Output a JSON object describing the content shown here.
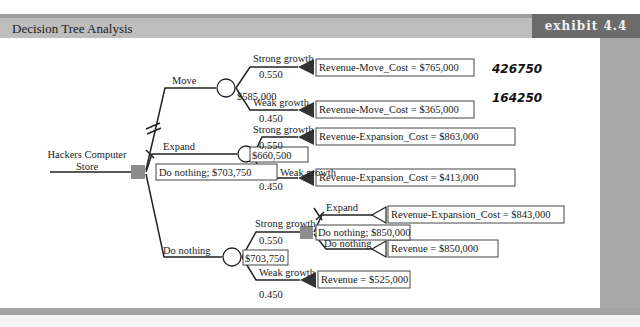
{
  "header": {
    "title": "Decision Tree Analysis",
    "exhibit_label": "exhibit 4.4"
  },
  "colors": {
    "header_bg": "#bdbdbd",
    "exhibit_bg": "#6b6b6b",
    "decision_node": "#8c8c8c",
    "line": "#222222"
  },
  "tree": {
    "root": {
      "label_line1": "Hackers Computer",
      "label_line2": "Store",
      "decision_value": "Do nothing; $703,750"
    },
    "move": {
      "label": "Move",
      "chance_value": "$585,000",
      "strong": {
        "label": "Strong growth",
        "prob": "0.550",
        "payoff": "Revenue-Move_Cost = $765,000",
        "note": "426750"
      },
      "weak": {
        "label": "Weak growth",
        "prob": "0.450",
        "payoff": "Revenue-Move_Cost = $365,000",
        "note": "164250"
      }
    },
    "expand": {
      "label": "Expand",
      "chance_value": "$660,500",
      "strong": {
        "label": "Strong growth",
        "prob": "0.550",
        "payoff": "Revenue-Expansion_Cost = $863,000"
      },
      "weak": {
        "label": "Weak growth",
        "prob": "0.450",
        "payoff": "Revenue-Expansion_Cost = $413,000"
      }
    },
    "do_nothing": {
      "label": "Do nothing",
      "chance_value": "$703,750",
      "strong": {
        "label": "Strong growth",
        "prob": "0.550",
        "decision_value": "Do nothing; $850,000",
        "expand": {
          "label": "Expand",
          "payoff": "Revenue-Expansion_Cost = $843,000"
        },
        "nothing": {
          "label": "Do nothing",
          "payoff": "Revenue = $850,000"
        }
      },
      "weak": {
        "label": "Weak growth",
        "prob": "0.450",
        "payoff": "Revenue = $525,000"
      }
    }
  }
}
